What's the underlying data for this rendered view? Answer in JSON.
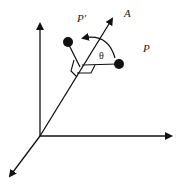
{
  "diagram": {
    "labels": {
      "axis": "A",
      "point_original": "P",
      "point_rotated": "P′",
      "angle": "θ"
    },
    "colors": {
      "stroke": "#111111",
      "background": "#ffffff"
    },
    "caption": ""
  }
}
